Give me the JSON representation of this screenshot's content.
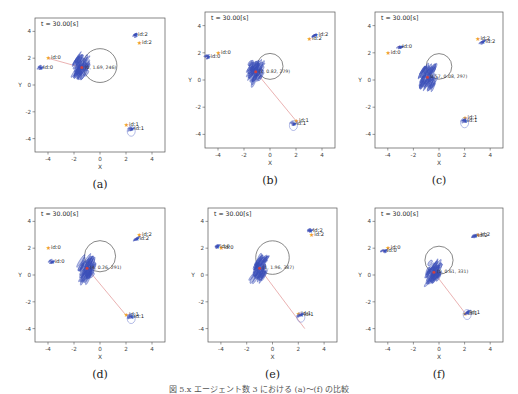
{
  "figure": {
    "caption": "図 5.x  エージェント数 3 における (a)〜(f) の比較",
    "caption_note": "caption is clipped at the bottom edge; partial",
    "panels": [
      {
        "id": "a",
        "label": "(a)",
        "title": "t = 30.00[s]",
        "xlabel": "X",
        "ylabel": "Y",
        "xticks": [
          "-4",
          "-2",
          "0",
          "2",
          "4"
        ],
        "yticks": [
          "4",
          "2",
          "0",
          "-2",
          "-4"
        ],
        "annotation": "(0, 1.69, 246)",
        "frame": {
          "left": 35,
          "top": 18,
          "width": 130,
          "height": 134
        },
        "circle": {
          "cx": 0.0,
          "cy": 1.45,
          "r": 1.3
        },
        "agents": [
          {
            "label": "id:0",
            "role": "goal",
            "x": -4.0,
            "y": 2.0
          },
          {
            "label": "id:0",
            "role": "robot",
            "x": -4.6,
            "y": 1.3
          },
          {
            "label": "id:1",
            "role": "goal",
            "x": 2.0,
            "y": -3.0
          },
          {
            "label": "id:1",
            "role": "robot",
            "x": 2.4,
            "y": -3.3
          },
          {
            "label": "id:2",
            "role": "robot",
            "x": 2.7,
            "y": 3.7
          },
          {
            "label": "id:2",
            "role": "goal",
            "x": 3.0,
            "y": 3.1
          }
        ],
        "center": {
          "x": -1.4,
          "y": 1.3
        },
        "line_to": {
          "x": -4.0,
          "y": 2.0
        }
      },
      {
        "id": "b",
        "label": "(b)",
        "title": "t = 30.00[s]",
        "xlabel": "X",
        "ylabel": "Y",
        "xticks": [
          "-4",
          "-2",
          "0",
          "2",
          "4"
        ],
        "yticks": [
          "4",
          "2",
          "0",
          "-2",
          "-4"
        ],
        "annotation": "(1, 0.82, 279)",
        "frame": {
          "left": 205,
          "top": 12,
          "width": 130,
          "height": 136
        },
        "circle": {
          "cx": 0.0,
          "cy": 1.0,
          "r": 1.0
        },
        "agents": [
          {
            "label": "id:0",
            "role": "goal",
            "x": -4.0,
            "y": 2.0
          },
          {
            "label": "id:0",
            "role": "robot",
            "x": -4.8,
            "y": 1.7
          },
          {
            "label": "id:1",
            "role": "goal",
            "x": 2.0,
            "y": -3.0
          },
          {
            "label": "id:1",
            "role": "robot",
            "x": 1.8,
            "y": -3.2
          },
          {
            "label": "id:2",
            "role": "goal",
            "x": 3.0,
            "y": 3.0
          },
          {
            "label": "id:2",
            "role": "robot",
            "x": 3.5,
            "y": 3.3
          }
        ],
        "center": {
          "x": -1.1,
          "y": 0.6
        },
        "line_to": {
          "x": 2.0,
          "y": -3.0
        }
      },
      {
        "id": "c",
        "label": "(c)",
        "title": "t = 30.00[s]",
        "xlabel": "X",
        "ylabel": "Y",
        "xticks": [
          "-4",
          "-2",
          "0",
          "2",
          "4"
        ],
        "yticks": [
          "4",
          "2",
          "0",
          "-2",
          "-4"
        ],
        "annotation": "0.57, 0.08, 297)",
        "frame": {
          "left": 375,
          "top": 12,
          "width": 128,
          "height": 136
        },
        "circle": {
          "cx": 0.0,
          "cy": 1.0,
          "r": 1.0
        },
        "agents": [
          {
            "label": "id:0",
            "role": "goal",
            "x": -4.0,
            "y": 2.0
          },
          {
            "label": "id:0",
            "role": "robot",
            "x": -3.1,
            "y": 2.4
          },
          {
            "label": "id:1",
            "role": "goal",
            "x": 2.0,
            "y": -2.8
          },
          {
            "label": "id:1",
            "role": "robot",
            "x": 2.0,
            "y": -3.0
          },
          {
            "label": "id:2",
            "role": "goal",
            "x": 3.0,
            "y": 3.0
          },
          {
            "label": "id:2",
            "role": "robot",
            "x": 3.4,
            "y": 2.8
          }
        ],
        "center": {
          "x": -0.9,
          "y": 0.2
        },
        "line_to": null
      },
      {
        "id": "d",
        "label": "(d)",
        "title": "t = 30.00[s]",
        "xlabel": "X",
        "ylabel": "Y",
        "xticks": [
          "-4",
          "-2",
          "0",
          "2",
          "4"
        ],
        "yticks": [
          "4",
          "2",
          "0",
          "-2",
          "-4"
        ],
        "annotation": "(4, 0.26, 291)",
        "frame": {
          "left": 35,
          "top": 208,
          "width": 130,
          "height": 134
        },
        "circle": {
          "cx": 0.0,
          "cy": 1.4,
          "r": 1.2
        },
        "agents": [
          {
            "label": "id:0",
            "role": "goal",
            "x": -4.0,
            "y": 2.0
          },
          {
            "label": "id:0",
            "role": "robot",
            "x": -3.7,
            "y": 1.0
          },
          {
            "label": "id:1",
            "role": "goal",
            "x": 2.0,
            "y": -3.0
          },
          {
            "label": "id:1",
            "role": "robot",
            "x": 2.4,
            "y": -3.1
          },
          {
            "label": "id:2",
            "role": "goal",
            "x": 3.0,
            "y": 3.0
          },
          {
            "label": "id:2",
            "role": "robot",
            "x": 2.8,
            "y": 2.7
          }
        ],
        "center": {
          "x": -1.0,
          "y": 0.5
        },
        "line_to": {
          "x": 2.0,
          "y": -3.0
        }
      },
      {
        "id": "e",
        "label": "(e)",
        "title": "t = 30.00[s]",
        "xlabel": "X",
        "ylabel": "Y",
        "xticks": [
          "-4",
          "-2",
          "0",
          "2",
          "4"
        ],
        "yticks": [
          "4",
          "2",
          "0",
          "-2",
          "-4"
        ],
        "annotation": "(1, 1.96, 387)",
        "frame": {
          "left": 208,
          "top": 208,
          "width": 129,
          "height": 134
        },
        "circle": {
          "cx": 0.0,
          "cy": 1.3,
          "r": 1.3
        },
        "agents": [
          {
            "label": "id:0",
            "role": "goal",
            "x": -4.0,
            "y": 2.0
          },
          {
            "label": "id:0",
            "role": "robot",
            "x": -4.3,
            "y": 2.1
          },
          {
            "label": "id:1",
            "role": "goal",
            "x": 2.0,
            "y": -2.9
          },
          {
            "label": "id:1",
            "role": "robot",
            "x": 2.2,
            "y": -3.0
          },
          {
            "label": "id:2",
            "role": "goal",
            "x": 3.0,
            "y": 3.0
          },
          {
            "label": "id:2",
            "role": "robot",
            "x": 2.9,
            "y": 3.3
          }
        ],
        "center": {
          "x": -1.0,
          "y": 0.5
        },
        "line_to": {
          "x": 2.5,
          "y": -4.0
        }
      },
      {
        "id": "f",
        "label": "(f)",
        "title": "t = 30.00[s]",
        "xlabel": "X",
        "ylabel": "Y",
        "xticks": [
          "-4",
          "-2",
          "0",
          "2",
          "4"
        ],
        "yticks": [
          "4",
          "2",
          "0",
          "-2",
          "-4"
        ],
        "annotation": "(0, 0.61, 331)",
        "frame": {
          "left": 375,
          "top": 208,
          "width": 128,
          "height": 134
        },
        "circle": {
          "cx": 0.0,
          "cy": 1.1,
          "r": 1.1
        },
        "agents": [
          {
            "label": "id:0",
            "role": "goal",
            "x": -4.0,
            "y": 2.0
          },
          {
            "label": "id:0",
            "role": "robot",
            "x": -4.3,
            "y": 1.8
          },
          {
            "label": "id:1",
            "role": "goal",
            "x": 2.0,
            "y": -2.9
          },
          {
            "label": "id:1",
            "role": "robot",
            "x": 2.2,
            "y": -2.8
          },
          {
            "label": "id:2",
            "role": "goal",
            "x": 3.0,
            "y": 3.0
          },
          {
            "label": "id:2",
            "role": "robot",
            "x": 2.8,
            "y": 2.9
          }
        ],
        "center": {
          "x": -0.4,
          "y": 0.2
        },
        "line_to": {
          "x": 2.0,
          "y": -2.8
        }
      }
    ]
  },
  "colors": {
    "robot": "#3b4fb8",
    "goal": "#f0a030",
    "circle": "#555555",
    "link_line": "#e08888",
    "axes": "#555555",
    "ellipse": "#6677cc"
  }
}
